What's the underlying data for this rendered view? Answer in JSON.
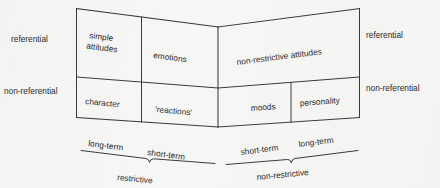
{
  "diagram": {
    "ink_color": "#3a3a3a",
    "background_color": "#f6f6f5",
    "left_panel": {
      "side_labels": {
        "top": "referential",
        "bottom": "non-referential"
      },
      "cells": {
        "top_left": "simple\nattitudes",
        "top_left_line1": "simple",
        "top_left_line2": "attitudes",
        "top_right": "emotions",
        "bottom_left": "character",
        "bottom_right": "'reactions'"
      },
      "axis": {
        "left_tick": "long-term",
        "right_tick": "short-term",
        "group": "restrictive"
      }
    },
    "right_panel": {
      "side_labels": {
        "top": "referential",
        "bottom": "non-referential"
      },
      "cells": {
        "top": "non-restrictive attitudes",
        "bottom_left": "moods",
        "bottom_right": "personality"
      },
      "axis": {
        "left_tick": "short-term",
        "right_tick": "long-term",
        "group": "non-restrictive"
      }
    }
  }
}
